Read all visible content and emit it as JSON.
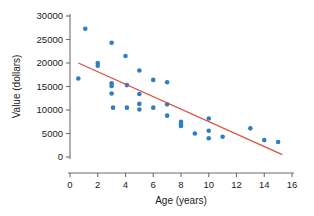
{
  "chart_data": {
    "type": "scatter",
    "title": "",
    "xlabel": "Age (years)",
    "ylabel": "Value (dollars)",
    "xlim": [
      0,
      16
    ],
    "ylim": [
      0,
      30000
    ],
    "xticks": [
      0,
      2,
      4,
      6,
      8,
      10,
      12,
      14,
      16
    ],
    "xtick_labels": [
      "0",
      "2",
      "4",
      "6",
      "8",
      "10",
      "12",
      "14",
      "16"
    ],
    "yticks": [
      0,
      5000,
      10000,
      15000,
      20000,
      25000,
      30000
    ],
    "ytick_labels": [
      "0",
      "5000",
      "10000",
      "15000",
      "20000",
      "25000",
      "30000"
    ],
    "grid": false,
    "legend": null,
    "point_color": "#2f7ec4",
    "line_color": "#d9503f",
    "axis_color": "#6e6e6e",
    "background_color": "#ffffff",
    "series": [
      {
        "name": "observations",
        "type": "scatter",
        "marker": "circle",
        "points": [
          [
            0.6,
            16700
          ],
          [
            1.1,
            27300
          ],
          [
            2.0,
            20000
          ],
          [
            2.0,
            19400
          ],
          [
            3.0,
            24300
          ],
          [
            3.0,
            15700
          ],
          [
            3.0,
            15100
          ],
          [
            3.0,
            13500
          ],
          [
            3.1,
            10500
          ],
          [
            4.0,
            21500
          ],
          [
            4.1,
            15300
          ],
          [
            4.1,
            10500
          ],
          [
            5.0,
            18400
          ],
          [
            5.0,
            13400
          ],
          [
            5.0,
            11300
          ],
          [
            5.0,
            10100
          ],
          [
            6.0,
            16400
          ],
          [
            6.0,
            10500
          ],
          [
            7.0,
            15900
          ],
          [
            7.0,
            11200
          ],
          [
            7.0,
            8800
          ],
          [
            8.0,
            7500
          ],
          [
            8.0,
            7000
          ],
          [
            8.0,
            6600
          ],
          [
            9.0,
            5000
          ],
          [
            10.0,
            8200
          ],
          [
            10.0,
            5600
          ],
          [
            10.0,
            4000
          ],
          [
            11.0,
            4300
          ],
          [
            13.0,
            6100
          ],
          [
            14.0,
            3600
          ],
          [
            15.0,
            3200
          ]
        ]
      },
      {
        "name": "regression-line",
        "type": "line",
        "endpoints": [
          [
            0.6,
            20000
          ],
          [
            15.3,
            500
          ]
        ]
      }
    ]
  }
}
